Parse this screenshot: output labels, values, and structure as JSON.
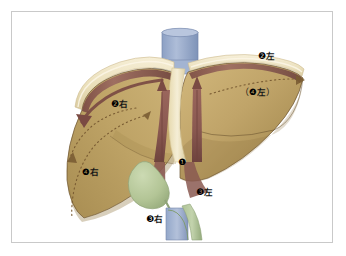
{
  "figure": {
    "background_color": "#ffffff",
    "frame_border_color": "#c9c9c9",
    "colors": {
      "liver_body_light": "#cdb377",
      "liver_body_mid": "#b79b5f",
      "liver_body_dark": "#9d8349",
      "liver_capsule_cream": "#ece0bd",
      "liver_capsule_pale": "#f4ecd2",
      "vessel_mauve": "#8d5c54",
      "vessel_mauve_dark": "#6f443e",
      "vessel_mauve_light": "#a87a6e",
      "ivc_blue": "#9fb2d2",
      "ivc_blue_dark": "#7e93b8",
      "gallbladder_green": "#b6c79a",
      "gallbladder_green_dark": "#8fa378",
      "bile_duct_green": "#9fb886",
      "outline_brown": "#6b5330",
      "dotted_brown": "#7a5c33",
      "label_text": "#111111"
    }
  },
  "annotations": [
    {
      "id": "seg2-left",
      "number": "❷",
      "side": "左",
      "open_paren": "",
      "close_paren": "",
      "x": 246,
      "y": 40
    },
    {
      "id": "seg2-right",
      "number": "❷",
      "side": "右",
      "open_paren": "",
      "close_paren": "",
      "x": 99,
      "y": 88
    },
    {
      "id": "seg4-left",
      "number": "❹",
      "side": "左",
      "open_paren": "（",
      "close_paren": "）",
      "x": 228,
      "y": 76
    },
    {
      "id": "seg4-right",
      "number": "❹",
      "side": "右",
      "open_paren": "",
      "close_paren": "",
      "x": 70,
      "y": 156
    },
    {
      "id": "seg1",
      "number": "❶",
      "side": "",
      "open_paren": "",
      "close_paren": "",
      "x": 166,
      "y": 146
    },
    {
      "id": "seg3-left",
      "number": "❸",
      "side": "左",
      "open_paren": "",
      "close_paren": "",
      "x": 184,
      "y": 176
    },
    {
      "id": "seg3-right",
      "number": "❸",
      "side": "右",
      "open_paren": "",
      "close_paren": "",
      "x": 134,
      "y": 203
    }
  ],
  "structures": [
    {
      "id": "inferior-vena-cava-superior",
      "label": "inferior vena cava"
    },
    {
      "id": "inferior-vena-cava-inferior",
      "label": "inferior vena cava"
    },
    {
      "id": "gallbladder",
      "label": "gallbladder"
    },
    {
      "id": "bile-duct",
      "label": "bile duct"
    },
    {
      "id": "right-hepatic-duct-trunk",
      "label": "right hepatic trunk"
    },
    {
      "id": "left-hepatic-duct-trunk",
      "label": "left hepatic trunk"
    },
    {
      "id": "right-lobe",
      "label": "right lobe"
    },
    {
      "id": "left-lobe",
      "label": "left lobe"
    },
    {
      "id": "falciform-fissure",
      "label": "interlobar fissure"
    }
  ]
}
